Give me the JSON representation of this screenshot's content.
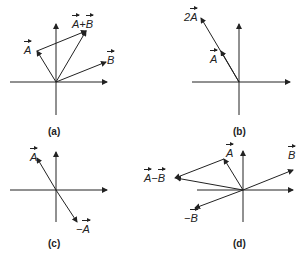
{
  "panels": [
    {
      "id": "a",
      "caption": "(a)",
      "labels": {
        "A": "A",
        "sum_left": "A",
        "plus": "+",
        "sum_right": "B",
        "B": "B"
      }
    },
    {
      "id": "b",
      "caption": "(b)",
      "labels": {
        "twoA_coef": "2",
        "twoA": "A",
        "A": "A"
      }
    },
    {
      "id": "c",
      "caption": "(c)",
      "labels": {
        "A": "A",
        "negA_sign": "−",
        "negA": "A"
      }
    },
    {
      "id": "d",
      "caption": "(d)",
      "labels": {
        "A": "A",
        "diff_left": "A",
        "minus": "−",
        "diff_right": "B",
        "B": "B",
        "negB_sign": "−",
        "negB": "B"
      }
    }
  ],
  "colors": {
    "ink": "#222222",
    "background": "#ffffff"
  }
}
